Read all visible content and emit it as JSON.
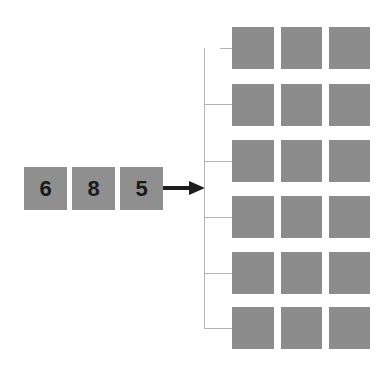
{
  "input": {
    "digits": [
      "6",
      "8",
      "5"
    ]
  },
  "arrow": {
    "direction": "right",
    "color": "#1e1e1e"
  },
  "output": {
    "rows": 6,
    "columns": 3,
    "cell_color": "#8c8c8c"
  }
}
